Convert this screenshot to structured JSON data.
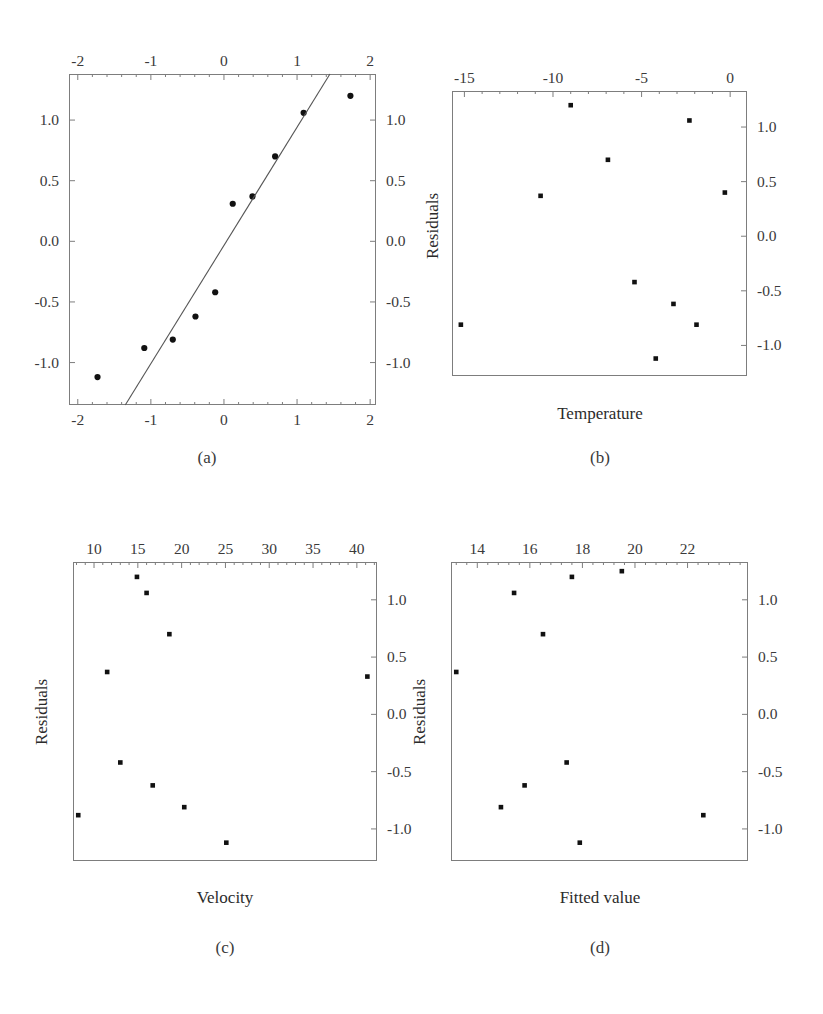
{
  "figure": {
    "background": "#ffffff",
    "frame_color": "#7d7d7d",
    "marker_color": "#111111",
    "line_color": "#555555",
    "panel_count": 4
  },
  "panels": [
    {
      "id": "a",
      "caption": "(a)",
      "xlabel": "",
      "ylabel": "",
      "x_ticks_top": [
        "-2",
        "-1",
        "0",
        "1",
        "2"
      ],
      "x_ticks_bottom": [
        "-2",
        "-1",
        "0",
        "1",
        "2"
      ],
      "y_ticks_left": [
        "1.0",
        "0.5",
        "0.0",
        "-0.5",
        "-1.0"
      ],
      "y_ticks_right": [
        "1.0",
        "0.5",
        "0.0",
        "-0.5",
        "-1.0"
      ]
    },
    {
      "id": "b",
      "caption": "(b)",
      "xlabel": "Temperature",
      "ylabel": "Residuals",
      "x_ticks_top": [
        "-15",
        "-10",
        "-5",
        "0"
      ],
      "y_ticks_right": [
        "1.0",
        "0.5",
        "0.0",
        "-0.5",
        "-1.0"
      ]
    },
    {
      "id": "c",
      "caption": "(c)",
      "xlabel": "Velocity",
      "ylabel": "Residuals",
      "x_ticks_top": [
        "10",
        "15",
        "20",
        "25",
        "30",
        "35",
        "40"
      ],
      "y_ticks_right": [
        "1.0",
        "0.5",
        "0.0",
        "-0.5",
        "-1.0"
      ]
    },
    {
      "id": "d",
      "caption": "(d)",
      "xlabel": "Fitted value",
      "ylabel": "Residuals",
      "x_ticks_top": [
        "14",
        "16",
        "18",
        "20",
        "22"
      ],
      "y_ticks_right": [
        "1.0",
        "0.5",
        "0.0",
        "-0.5",
        "-1.0"
      ]
    }
  ],
  "chart_data": [
    {
      "panel": "a",
      "type": "scatter",
      "title": "",
      "subtitle": "",
      "xlabel": "",
      "ylabel": "",
      "caption": "(a)",
      "xlim": [
        -2.12,
        2.08
      ],
      "ylim": [
        -1.35,
        1.38
      ],
      "grid": false,
      "legend": null,
      "axes": {
        "x_major_ticks": [
          -2,
          -1,
          0,
          1,
          2
        ],
        "y_major_ticks": [
          1.0,
          0.5,
          0.0,
          -0.5,
          -1.0
        ],
        "x_tick_labels_top": [
          "-2",
          "-1",
          "0",
          "1",
          "2"
        ],
        "x_tick_labels_bottom": [
          "-2",
          "-1",
          "0",
          "1",
          "2"
        ],
        "y_tick_labels_left": [
          "1.0",
          "0.5",
          "0.0",
          "-0.5",
          "-1.0"
        ],
        "y_tick_labels_right": [
          "1.0",
          "0.5",
          "0.0",
          "-0.5",
          "-1.0"
        ],
        "minor_ticks_per_major_x": 5,
        "minor_ticks_per_major_y": 5
      },
      "series": [
        {
          "name": "normal probability points",
          "marker": "filled-circle",
          "x": [
            -1.73,
            -1.09,
            -0.7,
            -0.39,
            -0.12,
            0.12,
            0.39,
            0.7,
            1.09,
            1.73
          ],
          "y": [
            -1.12,
            -0.88,
            -0.81,
            -0.62,
            -0.42,
            0.31,
            0.37,
            0.7,
            1.06,
            1.2
          ]
        },
        {
          "name": "reference line",
          "marker": "none",
          "type": "line",
          "x": [
            -1.35,
            1.45
          ],
          "y": [
            -1.35,
            1.38
          ]
        }
      ]
    },
    {
      "panel": "b",
      "type": "scatter",
      "title": "",
      "xlabel": "Temperature",
      "ylabel": "Residuals",
      "caption": "(b)",
      "xlim": [
        -15.7,
        0.95
      ],
      "ylim": [
        -1.28,
        1.33
      ],
      "grid": false,
      "legend": null,
      "axes": {
        "x_major_ticks": [
          -15,
          -10,
          -5,
          0
        ],
        "y_major_ticks": [
          1.0,
          0.5,
          0.0,
          -0.5,
          -1.0
        ],
        "x_tick_labels_top": [
          "-15",
          "-10",
          "-5",
          "0"
        ],
        "y_tick_labels_right": [
          "1.0",
          "0.5",
          "0.0",
          "-0.5",
          "-1.0"
        ]
      },
      "series": [
        {
          "name": "residuals vs temperature",
          "marker": "filled-square",
          "x": [
            -15.2,
            -10.7,
            -9.0,
            -6.9,
            -5.4,
            -4.2,
            -3.2,
            -2.3,
            -1.9,
            -0.3
          ],
          "y": [
            -0.81,
            0.37,
            1.2,
            0.7,
            -0.42,
            -1.12,
            -0.62,
            1.06,
            -0.81,
            0.4
          ]
        }
      ]
    },
    {
      "panel": "c",
      "type": "scatter",
      "title": "",
      "xlabel": "Velocity",
      "ylabel": "Residuals",
      "caption": "(c)",
      "xlim": [
        7.6,
        42.3
      ],
      "ylim": [
        -1.28,
        1.33
      ],
      "grid": false,
      "legend": null,
      "axes": {
        "x_major_ticks": [
          10,
          15,
          20,
          25,
          30,
          35,
          40
        ],
        "y_major_ticks": [
          1.0,
          0.5,
          0.0,
          -0.5,
          -1.0
        ],
        "x_tick_labels_top": [
          "10",
          "15",
          "20",
          "25",
          "30",
          "35",
          "40"
        ],
        "y_tick_labels_right": [
          "1.0",
          "0.5",
          "0.0",
          "-0.5",
          "-1.0"
        ]
      },
      "series": [
        {
          "name": "residuals vs velocity",
          "marker": "filled-square",
          "x": [
            8.2,
            11.5,
            13.0,
            14.9,
            16.0,
            16.7,
            18.6,
            20.3,
            25.1,
            41.2
          ],
          "y": [
            -0.88,
            0.37,
            -0.42,
            1.2,
            1.06,
            -0.62,
            0.7,
            -0.81,
            -1.12,
            0.33
          ]
        }
      ]
    },
    {
      "panel": "d",
      "type": "scatter",
      "title": "",
      "xlabel": "Fitted value",
      "ylabel": "Residuals",
      "caption": "(d)",
      "xlim": [
        13.0,
        24.3
      ],
      "ylim": [
        -1.28,
        1.33
      ],
      "grid": false,
      "legend": null,
      "axes": {
        "x_major_ticks": [
          14,
          16,
          18,
          20,
          22
        ],
        "y_major_ticks": [
          1.0,
          0.5,
          0.0,
          -0.5,
          -1.0
        ],
        "x_tick_labels_top": [
          "14",
          "16",
          "18",
          "20",
          "22"
        ],
        "y_tick_labels_right": [
          "1.0",
          "0.5",
          "0.0",
          "-0.5",
          "-1.0"
        ]
      },
      "series": [
        {
          "name": "residuals vs fitted value",
          "marker": "filled-square",
          "x": [
            13.2,
            14.9,
            15.4,
            15.8,
            16.5,
            17.4,
            17.6,
            19.5,
            17.9,
            22.6
          ],
          "y": [
            0.37,
            -0.81,
            1.06,
            -0.62,
            0.7,
            -0.42,
            1.2,
            1.25,
            -1.12,
            -0.88
          ]
        }
      ]
    }
  ]
}
